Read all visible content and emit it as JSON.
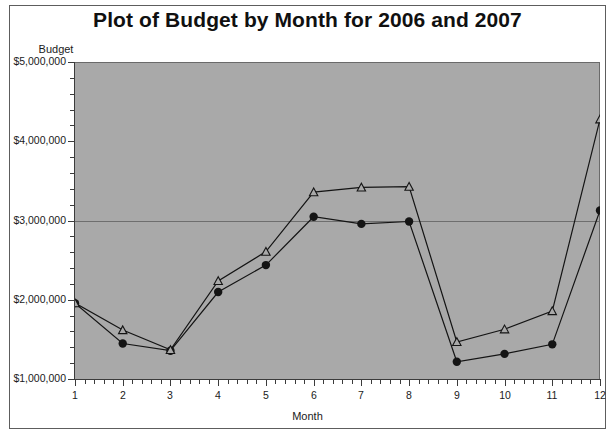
{
  "chart_data": {
    "type": "line",
    "title": "Plot of Budget by Month for 2006 and 2007",
    "xlabel": "Month",
    "ylabel": "Budget",
    "x": [
      1,
      2,
      3,
      4,
      5,
      6,
      7,
      8,
      9,
      10,
      11,
      12
    ],
    "xtick_labels": [
      "1",
      "2",
      "3",
      "4",
      "5",
      "6",
      "7",
      "8",
      "9",
      "10",
      "11",
      "12"
    ],
    "ytick_labels": [
      "$1,000,000",
      "$2,000,000",
      "$3,000,000",
      "$4,000,000",
      "$5,000,000"
    ],
    "ytick_values": [
      1000000,
      2000000,
      3000000,
      4000000,
      5000000
    ],
    "xlim": [
      1,
      12
    ],
    "ylim": [
      1000000,
      5000000
    ],
    "grid": "horizontal-single-at-3000000",
    "gridline_values": [
      3000000
    ],
    "legend": "none",
    "plot_background": "#a9a9a9",
    "line_color": "#1a1a1a",
    "series": [
      {
        "name": "2006",
        "marker": "filled-circle",
        "color": "#141414",
        "values": [
          1970000,
          1460000,
          1370000,
          2110000,
          2450000,
          3060000,
          2970000,
          3000000,
          1230000,
          1330000,
          1450000,
          3140000
        ]
      },
      {
        "name": "2007",
        "marker": "open-triangle",
        "color": "#141414",
        "values": [
          1970000,
          1630000,
          1380000,
          2250000,
          2620000,
          3370000,
          3430000,
          3440000,
          1480000,
          1640000,
          1870000,
          4290000
        ]
      }
    ]
  }
}
